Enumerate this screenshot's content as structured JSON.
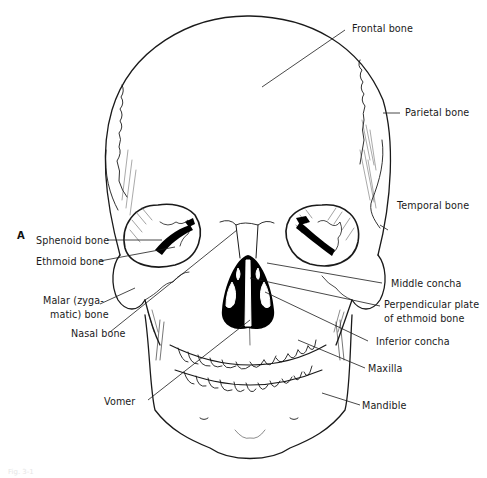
{
  "figure": {
    "panel_letter": "A",
    "caption_faint": "Fig. 3-1"
  },
  "labels": {
    "frontal_bone": "Frontal bone",
    "parietal_bone": "Parietal bone",
    "temporal_bone": "Temporal bone",
    "sphenoid_bone": "Sphenoid bone",
    "ethmoid_bone": "Ethmoid bone",
    "malar_line1": "Malar (zyga-",
    "malar_line2": "matic) bone",
    "nasal_bone": "Nasal bone",
    "middle_concha": "Middle concha",
    "perpendicular_line1": "Perpendicular plate",
    "perpendicular_line2": "of ethmoid bone",
    "inferior_concha": "Inferior concha",
    "maxilla": "Maxilla",
    "vomer": "Vomer",
    "mandible": "Mandible"
  },
  "colors": {
    "line": "#1a1a1a",
    "background": "#ffffff",
    "fill_dark": "#000000"
  }
}
